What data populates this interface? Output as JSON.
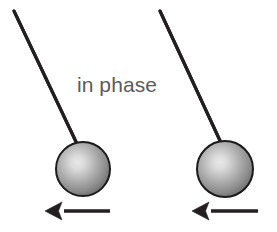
{
  "figure": {
    "name": "two-pendulums-in-phase-diagram",
    "width": 277,
    "height": 232,
    "background_color": "#ffffff"
  },
  "label": {
    "text": "in phase",
    "color": "#5b5b5b",
    "font_size_px": 21,
    "center_x": 117,
    "baseline_y": 92
  },
  "colors": {
    "ink": "#231f20",
    "bob_outline": "#1d1a1b",
    "bob_highlight": "#e3e3e3",
    "bob_mid": "#a8a8a8",
    "bob_edge": "#6f6f6f",
    "label_gray": "#5b5b5b",
    "background": "#ffffff"
  },
  "pendulums": [
    {
      "id": "left-pendulum",
      "label": "left pendulum",
      "pivot": {
        "x": 14,
        "y": 11
      },
      "bob_attach": {
        "x": 78,
        "y": 146
      },
      "bob_center": {
        "x": 83,
        "y": 169
      },
      "bob_radius": 27,
      "rod_stroke_width": 3.1,
      "swing_direction": "left",
      "arrow": {
        "id": "left-velocity-arrow",
        "tail_x": 110,
        "tip_x": 45,
        "y": 211,
        "direction": "left",
        "shaft_width": 3.4,
        "head_length": 17,
        "head_half_height": 9
      }
    },
    {
      "id": "right-pendulum",
      "label": "right pendulum",
      "pivot": {
        "x": 160,
        "y": 11
      },
      "bob_attach": {
        "x": 222,
        "y": 145
      },
      "bob_center": {
        "x": 225,
        "y": 169
      },
      "bob_radius": 28,
      "rod_stroke_width": 3.1,
      "swing_direction": "left",
      "arrow": {
        "id": "right-velocity-arrow",
        "tail_x": 258,
        "tip_x": 192,
        "y": 211,
        "direction": "left",
        "shaft_width": 3.4,
        "head_length": 17,
        "head_half_height": 9
      }
    }
  ]
}
